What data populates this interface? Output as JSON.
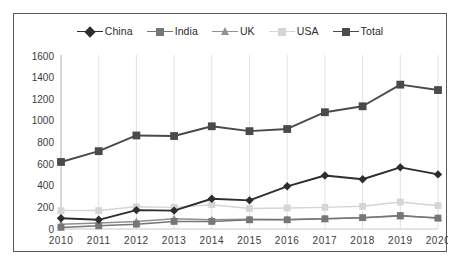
{
  "chart_data": {
    "type": "line",
    "title": "",
    "subtitle": "",
    "xlabel": "",
    "ylabel": "",
    "categories": [
      "2010",
      "2011",
      "2012",
      "2013",
      "2014",
      "2015",
      "2016",
      "2017",
      "2018",
      "2019",
      "2020"
    ],
    "ylim": [
      0,
      1600
    ],
    "ytick_step": 200,
    "yticks": [
      "1600",
      "1400",
      "1200",
      "1000",
      "800",
      "600",
      "400",
      "200",
      "0"
    ],
    "grid": "vertical",
    "legend_position": "top-center",
    "series": [
      {
        "name": "China",
        "marker": "diamond",
        "color": "#2d2d2d",
        "values": [
          100,
          85,
          175,
          170,
          280,
          265,
          395,
          495,
          460,
          570,
          505
        ]
      },
      {
        "name": "India",
        "marker": "square",
        "color": "#767676",
        "values": [
          15,
          30,
          45,
          70,
          70,
          85,
          85,
          95,
          105,
          125,
          100
        ]
      },
      {
        "name": "UK",
        "marker": "triangle",
        "color": "#909090",
        "values": [
          45,
          55,
          70,
          95,
          85,
          90,
          88,
          95,
          105,
          120,
          105
        ]
      },
      {
        "name": "USA",
        "marker": "square",
        "color": "#d5d5d5",
        "values": [
          170,
          170,
          205,
          200,
          225,
          190,
          195,
          200,
          210,
          250,
          215
        ]
      },
      {
        "name": "Total",
        "marker": "square",
        "color": "#4a4a4a",
        "values": [
          620,
          720,
          865,
          860,
          950,
          905,
          925,
          1080,
          1135,
          1335,
          1285
        ]
      }
    ]
  },
  "colors": {
    "frame_border": "#5a5a5a",
    "gridline": "#e2e2e2",
    "axis_text": "#3c3c3c",
    "background": "#ffffff"
  }
}
